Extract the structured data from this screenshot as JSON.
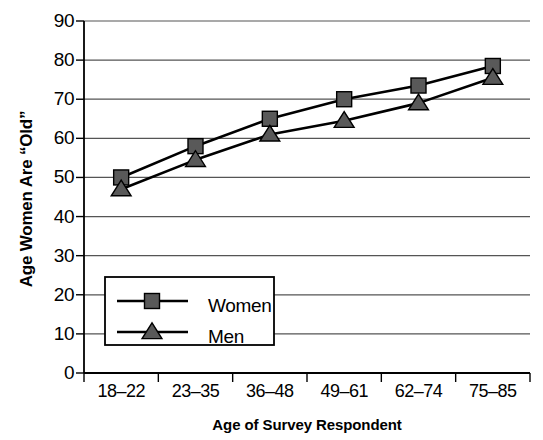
{
  "chart_data": {
    "type": "line",
    "title": "",
    "xlabel": "Age of Survey Respondent",
    "ylabel": "Age Women Are “Old”",
    "categories": [
      "18–22",
      "23–35",
      "36–48",
      "49–61",
      "62–74",
      "75–85"
    ],
    "series": [
      {
        "name": "Women",
        "marker": "square",
        "values": [
          50,
          58,
          65,
          70,
          73.5,
          78.5
        ]
      },
      {
        "name": "Men",
        "marker": "triangle",
        "values": [
          47,
          54.5,
          61,
          64.5,
          69,
          75.5
        ]
      }
    ],
    "ylim": [
      0,
      90
    ],
    "ytick_step": 10,
    "yticks": [
      "0",
      "10",
      "20",
      "30",
      "40",
      "50",
      "60",
      "70",
      "80",
      "90"
    ],
    "grid": "horizontal",
    "legend_position": "lower-left-inside",
    "colors": {
      "marker_fill": "#595959",
      "line": "#000000",
      "grid": "#555555",
      "axis": "#000000",
      "background": "#ffffff"
    }
  }
}
